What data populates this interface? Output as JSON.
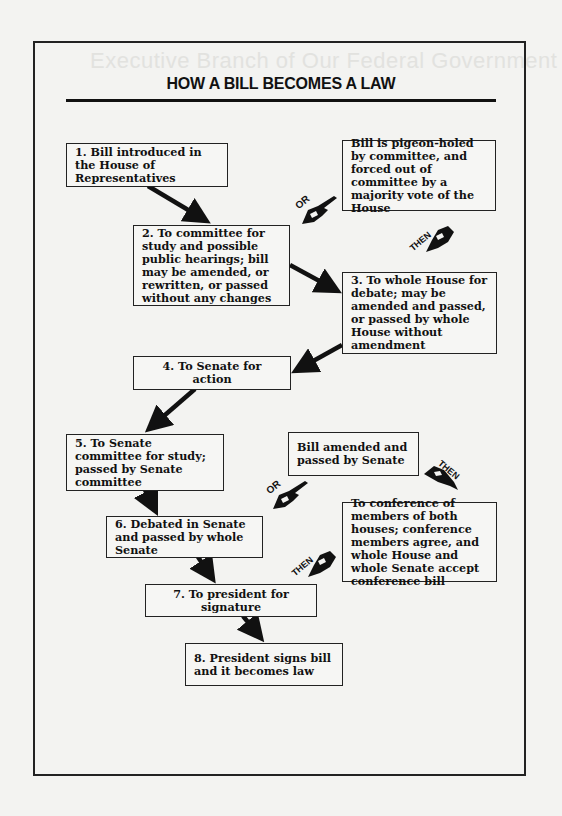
{
  "document": {
    "title": "HOW A BILL BECOMES A LAW",
    "bleed_through": [
      "Executive Branch of Our Federal Government",
      "How Laws"
    ]
  },
  "steps": [
    {
      "id": 1,
      "text": "1. Bill introduced in the House of Representatives"
    },
    {
      "id": 2,
      "text": "2. To committee for study and possible public hearings; bill may be amended, or rewritten, or passed without any changes"
    },
    {
      "id": 3,
      "text": "3. To whole House for debate; may be amended and passed, or passed by whole House without amendment"
    },
    {
      "id": 4,
      "text": "4. To Senate for action"
    },
    {
      "id": 5,
      "text": "5. To Senate committee for study; passed by Senate committee"
    },
    {
      "id": 6,
      "text": "6. Debated in Senate and passed by whole Senate"
    },
    {
      "id": 7,
      "text": "7. To president for signature"
    },
    {
      "id": 8,
      "text": "8. President signs bill and it becomes law"
    }
  ],
  "alternates": {
    "pigeon_holed": "Bill is pigeon-holed by committee, and forced out of committee by a majority vote of the House",
    "amended_by_senate": "Bill amended and passed by Senate",
    "conference": "To conference of members of both houses; conference members agree, and whole House and whole Senate accept conference bill"
  },
  "connectors": {
    "or_label": "OR",
    "then_label": "THEN"
  }
}
